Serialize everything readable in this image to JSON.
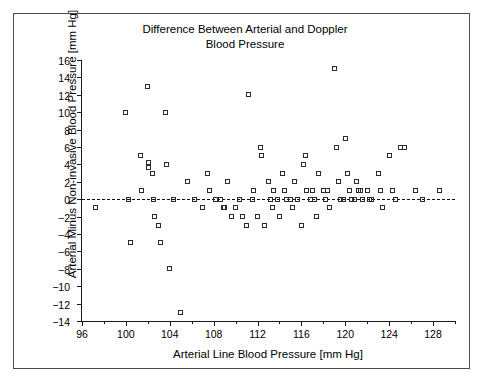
{
  "chart_data": {
    "type": "scatter",
    "title": "Difference Between Arterial and Doppler\nBlood Pressure",
    "xlabel": "Arterial Line Blood Pressure [mm Hg]",
    "ylabel": "Arterial Minus Non-invasive Blood Pressure [mm Hg]",
    "xlim": [
      96,
      130
    ],
    "ylim": [
      -14,
      16
    ],
    "xticks": [
      96,
      100,
      104,
      108,
      112,
      116,
      120,
      124,
      128
    ],
    "xticks_minor": [
      98,
      102,
      106,
      110,
      114,
      118,
      122,
      126,
      130
    ],
    "yticks": [
      -14,
      -12,
      -10,
      -8,
      -6,
      -4,
      -2,
      0,
      2,
      4,
      6,
      8,
      10,
      12,
      14,
      16
    ],
    "grid": false,
    "legend": null,
    "marker": "open-square",
    "marker_color": "#2b2b2b",
    "reference_line": {
      "y": 0,
      "style": "dashed",
      "color": "#111111"
    },
    "points": [
      [
        97.2,
        -1
      ],
      [
        100.0,
        10
      ],
      [
        100.2,
        0
      ],
      [
        100.4,
        -5
      ],
      [
        101.3,
        5
      ],
      [
        101.4,
        1
      ],
      [
        102.0,
        13
      ],
      [
        102.1,
        3.6
      ],
      [
        102.1,
        4.2
      ],
      [
        102.4,
        3
      ],
      [
        102.5,
        0
      ],
      [
        102.6,
        -2
      ],
      [
        103.0,
        -3
      ],
      [
        103.2,
        -5
      ],
      [
        103.6,
        10
      ],
      [
        103.7,
        4
      ],
      [
        104.0,
        -8
      ],
      [
        104.3,
        0
      ],
      [
        105.0,
        -13
      ],
      [
        105.6,
        2
      ],
      [
        106.3,
        0
      ],
      [
        107.0,
        -1
      ],
      [
        107.4,
        3
      ],
      [
        107.6,
        1
      ],
      [
        108.2,
        0
      ],
      [
        108.6,
        0
      ],
      [
        108.9,
        -1
      ],
      [
        109.0,
        -1
      ],
      [
        109.3,
        2
      ],
      [
        109.6,
        -2
      ],
      [
        110.0,
        -1
      ],
      [
        110.4,
        0
      ],
      [
        110.6,
        -2
      ],
      [
        111.0,
        -3
      ],
      [
        111.2,
        12
      ],
      [
        111.5,
        0
      ],
      [
        111.6,
        1
      ],
      [
        112.0,
        -2
      ],
      [
        112.3,
        6
      ],
      [
        112.4,
        5
      ],
      [
        112.6,
        -3
      ],
      [
        113.0,
        2
      ],
      [
        113.2,
        0
      ],
      [
        113.4,
        -1
      ],
      [
        113.5,
        1
      ],
      [
        113.8,
        0
      ],
      [
        114.0,
        -2
      ],
      [
        114.3,
        3
      ],
      [
        114.5,
        1
      ],
      [
        114.6,
        0
      ],
      [
        115.0,
        0
      ],
      [
        115.2,
        -1
      ],
      [
        115.4,
        2
      ],
      [
        115.6,
        0
      ],
      [
        116.0,
        -3
      ],
      [
        116.2,
        4
      ],
      [
        116.4,
        5
      ],
      [
        116.5,
        1
      ],
      [
        116.8,
        0
      ],
      [
        117.0,
        1
      ],
      [
        117.2,
        0
      ],
      [
        117.4,
        -2
      ],
      [
        117.6,
        3
      ],
      [
        118.0,
        1
      ],
      [
        118.2,
        0
      ],
      [
        118.4,
        1
      ],
      [
        118.6,
        -1
      ],
      [
        119.0,
        15
      ],
      [
        119.2,
        6
      ],
      [
        119.4,
        2
      ],
      [
        119.6,
        0
      ],
      [
        119.8,
        0
      ],
      [
        120.0,
        7
      ],
      [
        120.2,
        3
      ],
      [
        120.4,
        1
      ],
      [
        120.6,
        0
      ],
      [
        120.8,
        0
      ],
      [
        121.0,
        2
      ],
      [
        121.2,
        1
      ],
      [
        121.4,
        1
      ],
      [
        121.6,
        0
      ],
      [
        122.0,
        1
      ],
      [
        122.2,
        0
      ],
      [
        122.4,
        0
      ],
      [
        123.0,
        3
      ],
      [
        123.2,
        1
      ],
      [
        123.4,
        -1
      ],
      [
        124.0,
        5
      ],
      [
        124.3,
        1
      ],
      [
        124.6,
        0
      ],
      [
        125.0,
        6
      ],
      [
        125.4,
        6
      ],
      [
        126.4,
        1
      ],
      [
        127.0,
        0
      ],
      [
        128.6,
        1
      ]
    ]
  }
}
